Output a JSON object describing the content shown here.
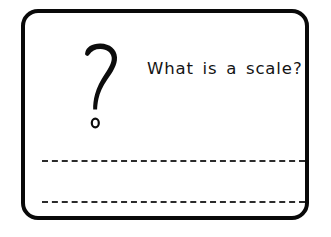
{
  "page": {
    "background_color": "#ffffff",
    "border_color": "#090909",
    "text_color": "#141414",
    "line_color": "#2b2b2b"
  },
  "worksheet": {
    "question": {
      "icon": "question-mark-glyph",
      "text": "What is a scale?"
    },
    "answer_lines": [
      {
        "id": "line-1",
        "value": ""
      },
      {
        "id": "line-2",
        "value": ""
      }
    ]
  }
}
